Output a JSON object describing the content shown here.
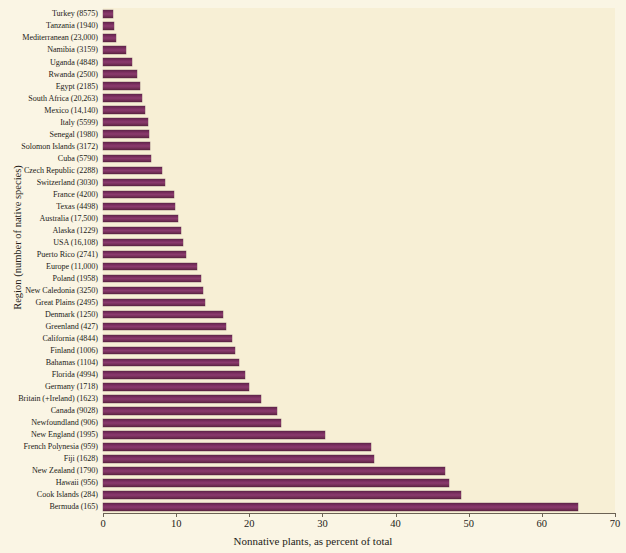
{
  "chart_data": {
    "type": "bar",
    "orientation": "horizontal",
    "title": "",
    "xlabel": "Nonnative plants, as percent of total",
    "ylabel": "Region (number of native species)",
    "xlim": [
      0,
      70
    ],
    "xticks": [
      0,
      10,
      20,
      30,
      40,
      50,
      60,
      70
    ],
    "xtick_labels": [
      "0",
      "10",
      "20",
      "30",
      "40",
      "50",
      "60",
      "70"
    ],
    "grid": false,
    "legend": "none",
    "bar_color": "#7b2f60",
    "plot_background": "#f7efd5",
    "categories": [
      "Turkey (8575)",
      "Tanzania (1940)",
      "Mediterranean (23,000)",
      "Namibia (3159)",
      "Uganda (4848)",
      "Rwanda (2500)",
      "Egypt (2185)",
      "South Africa (20,263)",
      "Mexico (14,140)",
      "Italy (5599)",
      "Senegal (1980)",
      "Solomon Islands (3172)",
      "Cuba (5790)",
      "Czech Republic (2288)",
      "Switzerland (3030)",
      "France (4200)",
      "Texas (4498)",
      "Australia (17,500)",
      "Alaska (1229)",
      "USA (16,108)",
      "Puerto Rico (2741)",
      "Europe (11,000)",
      "Poland (1958)",
      "New Caledonia (3250)",
      "Great Plains (2495)",
      "Denmark (1250)",
      "Greenland (427)",
      "California (4844)",
      "Finland (1006)",
      "Bahamas (1104)",
      "Florida (4994)",
      "Germany (1718)",
      "Britain (+Ireland) (1623)",
      "Canada (9028)",
      "Newfoundland (906)",
      "New England (1995)",
      "French Polynesia (959)",
      "Fiji (1628)",
      "New Zealand (1790)",
      "Hawaii (956)",
      "Cook Islands (284)",
      "Bermuda (165)"
    ],
    "values": [
      1.4,
      1.5,
      1.8,
      3.1,
      4.0,
      4.6,
      5.0,
      5.3,
      5.7,
      6.1,
      6.3,
      6.4,
      6.5,
      8.1,
      8.5,
      9.7,
      9.9,
      10.3,
      10.6,
      11.0,
      11.3,
      12.8,
      13.4,
      13.7,
      13.9,
      16.4,
      16.8,
      17.6,
      18.0,
      18.6,
      19.4,
      20.0,
      21.6,
      23.8,
      24.3,
      30.3,
      36.7,
      37.1,
      46.8,
      47.3,
      48.9,
      65.0
    ],
    "series_name": "Nonnative plants, as percent of total"
  },
  "ghost_text": {
    "heading": "The Dynamic Geography of Extinction Forces",
    "subheading": "The ecology and geography of invasions",
    "figure_caption": "FIGURE 16.5",
    "lines": [
      "in this book,",
      "of native species",
      "the number of",
      "nonnative",
      "species",
      "in many",
      "regions",
      "has grown"
    ]
  }
}
